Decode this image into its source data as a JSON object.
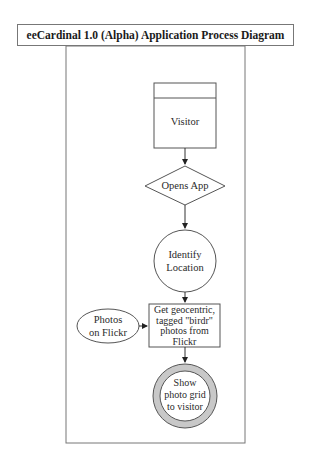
{
  "diagram": {
    "title": "eeCardinal 1.0 (Alpha) Application Process Diagram",
    "nodes": [
      {
        "id": "visitor",
        "shape": "actor-box",
        "label": "Visitor"
      },
      {
        "id": "opens_app",
        "shape": "diamond",
        "label": "Opens App"
      },
      {
        "id": "identify_location",
        "shape": "circle",
        "label_lines": [
          "Identify",
          "Location"
        ]
      },
      {
        "id": "get_photos",
        "shape": "rectangle",
        "label_lines": [
          "Get geocentric,",
          "tagged \"birdr\"",
          "photos from",
          "Flickr"
        ]
      },
      {
        "id": "photos_on_flickr",
        "shape": "ellipse",
        "label_lines": [
          "Photos",
          "on Flickr"
        ]
      },
      {
        "id": "show_grid",
        "shape": "double-circle",
        "label_lines": [
          "Show",
          "photo grid",
          "to visitor"
        ]
      }
    ],
    "edges": [
      {
        "from": "visitor",
        "to": "opens_app"
      },
      {
        "from": "opens_app",
        "to": "identify_location"
      },
      {
        "from": "identify_location",
        "to": "get_photos"
      },
      {
        "from": "photos_on_flickr",
        "to": "get_photos"
      },
      {
        "from": "get_photos",
        "to": "show_grid"
      }
    ],
    "colors": {
      "stroke": "#555555",
      "ring_fill": "#c8c8c8",
      "background": "#ffffff"
    }
  }
}
